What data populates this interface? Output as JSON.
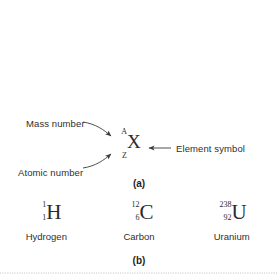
{
  "figure": {
    "background_color": "#ffffff",
    "text_color": "#2f2f2f"
  },
  "panel_a": {
    "caption": "(a)",
    "nuclide": {
      "mass_number": "A",
      "atomic_number": "Z",
      "symbol": "X"
    },
    "annotations": {
      "mass_number_label": "Mass number",
      "atomic_number_label": "Atomic number",
      "element_symbol_label": "Element symbol"
    }
  },
  "panel_b": {
    "caption": "(b)",
    "isotopes": [
      {
        "mass_number": "1",
        "atomic_number": "1",
        "symbol": "H",
        "name": "Hydrogen"
      },
      {
        "mass_number": "12",
        "atomic_number": "6",
        "symbol": "C",
        "name": "Carbon"
      },
      {
        "mass_number": "238",
        "atomic_number": "92",
        "symbol": "U",
        "name": "Uranium"
      }
    ]
  }
}
